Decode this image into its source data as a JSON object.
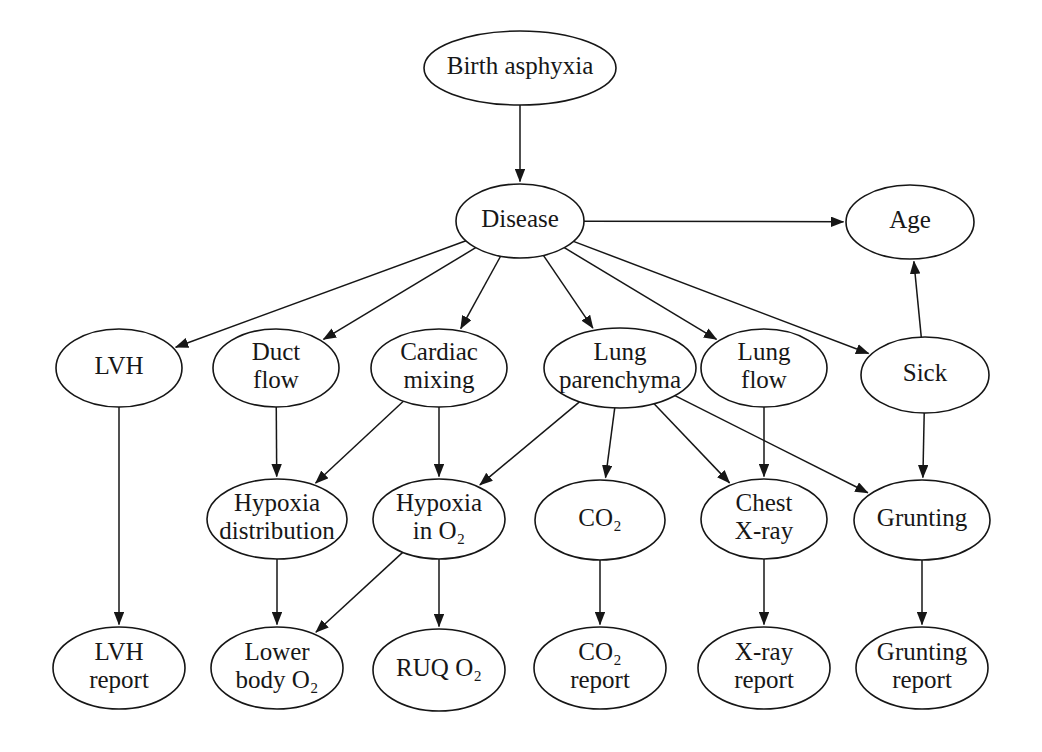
{
  "diagram": {
    "type": "directed-acyclic-graph",
    "node_shape": "ellipse",
    "stroke_color": "#161616",
    "fill_color": "#ffffff",
    "background_color": "#ffffff",
    "arrowhead": "filled-triangle"
  },
  "nodes": [
    {
      "id": "birth_asphyxia",
      "label": "Birth asphyxia",
      "cx": 520,
      "cy": 68,
      "rx": 96,
      "ry": 37,
      "lines": [
        "Birth asphyxia"
      ]
    },
    {
      "id": "disease",
      "label": "Disease",
      "cx": 520,
      "cy": 221,
      "rx": 64,
      "ry": 37,
      "lines": [
        "Disease"
      ]
    },
    {
      "id": "age",
      "label": "Age",
      "cx": 910,
      "cy": 222,
      "rx": 64,
      "ry": 37,
      "lines": [
        "Age"
      ]
    },
    {
      "id": "lvh",
      "label": "LVH",
      "cx": 119,
      "cy": 368,
      "rx": 63,
      "ry": 39,
      "lines": [
        "LVH"
      ]
    },
    {
      "id": "duct_flow",
      "label": "Duct flow",
      "cx": 276,
      "cy": 368,
      "rx": 63,
      "ry": 39,
      "lines": [
        "Duct",
        "flow"
      ]
    },
    {
      "id": "cardiac_mixing",
      "label": "Cardiac mixing",
      "cx": 439,
      "cy": 368,
      "rx": 68,
      "ry": 39,
      "lines": [
        "Cardiac",
        "mixing"
      ]
    },
    {
      "id": "lung_parenchyma",
      "label": "Lung parenchyma",
      "cx": 620,
      "cy": 368,
      "rx": 76,
      "ry": 40,
      "lines": [
        "Lung",
        "parenchyma"
      ]
    },
    {
      "id": "lung_flow",
      "label": "Lung flow",
      "cx": 764,
      "cy": 368,
      "rx": 63,
      "ry": 39,
      "lines": [
        "Lung",
        "flow"
      ]
    },
    {
      "id": "sick",
      "label": "Sick",
      "cx": 925,
      "cy": 375,
      "rx": 64,
      "ry": 38,
      "lines": [
        "Sick"
      ]
    },
    {
      "id": "hypoxia_distribution",
      "label": "Hypoxia distribution",
      "cx": 277,
      "cy": 519,
      "rx": 70,
      "ry": 40,
      "lines": [
        "Hypoxia",
        "distribution"
      ]
    },
    {
      "id": "hypoxia_in_o2",
      "label": "Hypoxia in O2",
      "cx": 439,
      "cy": 519,
      "rx": 66,
      "ry": 40,
      "lines": [
        "Hypoxia",
        "in O₂"
      ]
    },
    {
      "id": "co2",
      "label": "CO2",
      "cx": 600,
      "cy": 520,
      "rx": 65,
      "ry": 40,
      "lines": [
        "CO₂"
      ]
    },
    {
      "id": "chest_xray",
      "label": "Chest X-ray",
      "cx": 764,
      "cy": 519,
      "rx": 63,
      "ry": 40,
      "lines": [
        "Chest",
        "X-ray"
      ]
    },
    {
      "id": "grunting",
      "label": "Grunting",
      "cx": 922,
      "cy": 520,
      "rx": 68,
      "ry": 40,
      "lines": [
        "Grunting"
      ]
    },
    {
      "id": "lvh_report",
      "label": "LVH report",
      "cx": 119,
      "cy": 668,
      "rx": 66,
      "ry": 41,
      "lines": [
        "LVH",
        "report"
      ]
    },
    {
      "id": "lower_body_o2",
      "label": "Lower body O2",
      "cx": 277,
      "cy": 668,
      "rx": 66,
      "ry": 41,
      "lines": [
        "Lower",
        "body O₂"
      ]
    },
    {
      "id": "ruq_o2",
      "label": "RUQ O2",
      "cx": 439,
      "cy": 670,
      "rx": 66,
      "ry": 41,
      "lines": [
        "RUQ O₂"
      ]
    },
    {
      "id": "co2_report",
      "label": "CO2 report",
      "cx": 600,
      "cy": 668,
      "rx": 66,
      "ry": 41,
      "lines": [
        "CO₂",
        "report"
      ]
    },
    {
      "id": "xray_report",
      "label": "X-ray report",
      "cx": 764,
      "cy": 668,
      "rx": 66,
      "ry": 41,
      "lines": [
        "X-ray",
        "report"
      ]
    },
    {
      "id": "grunting_report",
      "label": "Grunting report",
      "cx": 922,
      "cy": 668,
      "rx": 66,
      "ry": 41,
      "lines": [
        "Grunting",
        "report"
      ]
    }
  ],
  "edges": [
    {
      "from": "birth_asphyxia",
      "to": "disease"
    },
    {
      "from": "disease",
      "to": "age"
    },
    {
      "from": "disease",
      "to": "lvh"
    },
    {
      "from": "disease",
      "to": "duct_flow"
    },
    {
      "from": "disease",
      "to": "cardiac_mixing"
    },
    {
      "from": "disease",
      "to": "lung_parenchyma"
    },
    {
      "from": "disease",
      "to": "lung_flow"
    },
    {
      "from": "disease",
      "to": "sick"
    },
    {
      "from": "sick",
      "to": "age"
    },
    {
      "from": "duct_flow",
      "to": "hypoxia_distribution"
    },
    {
      "from": "cardiac_mixing",
      "to": "hypoxia_distribution"
    },
    {
      "from": "cardiac_mixing",
      "to": "hypoxia_in_o2"
    },
    {
      "from": "lung_parenchyma",
      "to": "hypoxia_in_o2"
    },
    {
      "from": "lung_parenchyma",
      "to": "co2"
    },
    {
      "from": "lung_parenchyma",
      "to": "chest_xray"
    },
    {
      "from": "lung_parenchyma",
      "to": "grunting"
    },
    {
      "from": "lung_flow",
      "to": "chest_xray"
    },
    {
      "from": "sick",
      "to": "grunting"
    },
    {
      "from": "lvh",
      "to": "lvh_report"
    },
    {
      "from": "hypoxia_distribution",
      "to": "lower_body_o2"
    },
    {
      "from": "hypoxia_in_o2",
      "to": "lower_body_o2"
    },
    {
      "from": "hypoxia_in_o2",
      "to": "ruq_o2"
    },
    {
      "from": "co2",
      "to": "co2_report"
    },
    {
      "from": "chest_xray",
      "to": "xray_report"
    },
    {
      "from": "grunting",
      "to": "grunting_report"
    }
  ]
}
